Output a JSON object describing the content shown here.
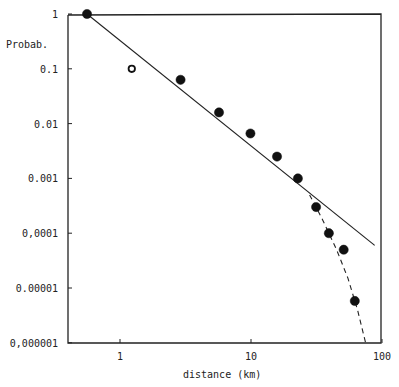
{
  "chart_data": {
    "type": "scatter",
    "title": "",
    "xlabel": "distance (km)",
    "ylabel": "Probab.",
    "xscale": "log",
    "yscale": "log",
    "xlim": [
      0.4,
      100
    ],
    "ylim": [
      1e-06,
      1
    ],
    "grid": false,
    "x_ticks": [
      {
        "value": 1,
        "label": "1"
      },
      {
        "value": 10,
        "label": "10"
      },
      {
        "value": 100,
        "label": "100"
      }
    ],
    "y_ticks": [
      {
        "value": 1,
        "label": "1"
      },
      {
        "value": 0.1,
        "label": "0.1"
      },
      {
        "value": 0.01,
        "label": "0.01"
      },
      {
        "value": 0.001,
        "label": "0.001"
      },
      {
        "value": 0.0001,
        "label": "0,0001"
      },
      {
        "value": 1e-05,
        "label": "0.00001"
      },
      {
        "value": 1e-06,
        "label": "0,000001"
      }
    ],
    "series": [
      {
        "name": "observed (filled)",
        "marker": "filled-circle",
        "x": [
          0.56,
          2.9,
          5.7,
          9.9,
          15.8,
          22.8,
          31.4,
          39.3,
          51,
          62
        ],
        "y": [
          1,
          0.063,
          0.016,
          0.0066,
          0.0025,
          0.001,
          0.0003,
          0.0001,
          5e-05,
          5.8e-06
        ]
      },
      {
        "name": "observed (open)",
        "marker": "open-circle",
        "x": [
          1.23
        ],
        "y": [
          0.1
        ]
      },
      {
        "name": "power-law fit",
        "style": "solid-line",
        "x": [
          0.56,
          88
        ],
        "y": [
          1,
          6e-05
        ]
      },
      {
        "name": "cutoff curve",
        "style": "dashed-line",
        "x": [
          28,
          35,
          45,
          55,
          65,
          75
        ],
        "y": [
          0.0005,
          0.00018,
          5e-05,
          1.5e-05,
          4e-06,
          1e-06
        ]
      }
    ]
  }
}
